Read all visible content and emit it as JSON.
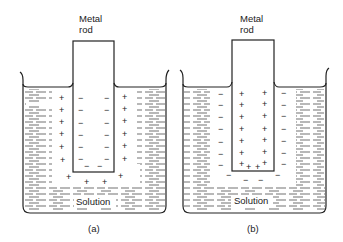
{
  "figure": {
    "type": "electrode double layer diagram",
    "panels": [
      {
        "id": "a",
        "caption": "(a)",
        "rod_label_line1": "Metal",
        "rod_label_line2": "rod",
        "solution_label": "Solution",
        "rod_charge": "-",
        "solution_charge": "+",
        "description": "Negatively charged metal rod surrounded by positive ions in solution"
      },
      {
        "id": "b",
        "caption": "(b)",
        "rod_label_line1": "Metal",
        "rod_label_line2": "rod",
        "solution_label": "Solution",
        "rod_charge": "+",
        "solution_charge": "-",
        "description": "Positively charged metal rod surrounded by negative ions in solution"
      }
    ]
  },
  "colors": {
    "line": "#222222",
    "background": "#ffffff"
  }
}
